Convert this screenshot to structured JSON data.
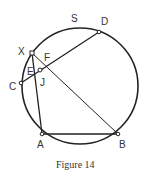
{
  "figure": {
    "caption": "Figure 14",
    "circle_label": "S",
    "circle": {
      "cx": 80,
      "cy": 86,
      "r": 58
    },
    "points": {
      "D": {
        "x": 99,
        "y": 32,
        "label": "D",
        "lx": 101,
        "ly": 25
      },
      "X": {
        "x": 32,
        "y": 53,
        "label": "X",
        "lx": 18,
        "ly": 55
      },
      "C": {
        "x": 21,
        "y": 83,
        "label": "C",
        "lx": 9,
        "ly": 90
      },
      "J": {
        "x": 40,
        "y": 70,
        "label": "J",
        "lx": 40,
        "ly": 86
      },
      "A": {
        "x": 42,
        "y": 134,
        "label": "A",
        "lx": 37,
        "ly": 148
      },
      "B": {
        "x": 118,
        "y": 134,
        "label": "B",
        "lx": 119,
        "ly": 148
      }
    },
    "extra_labels": {
      "E": {
        "label": "E",
        "x": 27,
        "y": 75
      },
      "F": {
        "label": "F",
        "x": 44,
        "y": 61
      }
    },
    "segments": [
      [
        "C",
        "D"
      ],
      [
        "X",
        "A"
      ],
      [
        "X",
        "B"
      ],
      [
        "A",
        "B"
      ]
    ],
    "colors": {
      "stroke": "#222222"
    }
  }
}
